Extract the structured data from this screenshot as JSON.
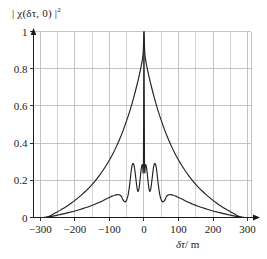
{
  "figure": {
    "ylabel": "| χ(δτ, 0) |",
    "ylabel_exponent": "2",
    "xlabel_symbol": "δτ",
    "xlabel_unit": "/ m",
    "xlabel_full": "δτ/m"
  },
  "chart_data": {
    "type": "line",
    "title": "",
    "subtitle": "",
    "xlabel": "δτ/m",
    "ylabel": "| χ(δτ, 0) |²",
    "xlim": [
      -320,
      310
    ],
    "ylim": [
      0,
      1
    ],
    "xticks": [
      -300,
      -200,
      -100,
      0,
      100,
      200,
      300
    ],
    "xtick_labels": [
      "−300",
      "−200",
      "−100",
      "0",
      "100",
      "200",
      "300"
    ],
    "yticks": [
      0,
      0.2,
      0.4,
      0.6,
      0.8,
      1
    ],
    "ytick_labels": [
      "0",
      "0.2",
      "0.4",
      "0.6",
      "0.8",
      "1"
    ],
    "minor_xtick_interval": 50,
    "grid": true,
    "grid_color": "#b4b4b4",
    "legend": null,
    "legend_position": "none",
    "line_color": "#222222",
    "series": [
      {
        "name": "broad-peak",
        "comment": "Wide near-exponential main lobe, unity at zero delay, decaying to zero near ±280 m",
        "x": [
          -285,
          -280,
          -270,
          -260,
          -250,
          -240,
          -230,
          -220,
          -210,
          -200,
          -190,
          -180,
          -170,
          -160,
          -150,
          -140,
          -130,
          -120,
          -110,
          -100,
          -90,
          -80,
          -70,
          -60,
          -50,
          -40,
          -30,
          -20,
          -14,
          -9,
          -5,
          -2,
          0,
          2,
          5,
          9,
          14,
          20,
          30,
          40,
          50,
          60,
          70,
          80,
          90,
          100,
          110,
          120,
          130,
          140,
          150,
          160,
          170,
          180,
          190,
          200,
          210,
          220,
          230,
          240,
          250,
          260,
          270,
          280,
          285
        ],
        "y": [
          0.0,
          0.003,
          0.011,
          0.021,
          0.031,
          0.042,
          0.053,
          0.065,
          0.078,
          0.092,
          0.107,
          0.123,
          0.14,
          0.158,
          0.178,
          0.2,
          0.224,
          0.25,
          0.278,
          0.309,
          0.343,
          0.381,
          0.423,
          0.47,
          0.522,
          0.579,
          0.643,
          0.715,
          0.763,
          0.806,
          0.845,
          0.895,
          1.0,
          0.895,
          0.845,
          0.806,
          0.763,
          0.715,
          0.643,
          0.579,
          0.522,
          0.47,
          0.423,
          0.381,
          0.343,
          0.309,
          0.278,
          0.25,
          0.224,
          0.2,
          0.178,
          0.158,
          0.14,
          0.123,
          0.107,
          0.092,
          0.078,
          0.065,
          0.053,
          0.042,
          0.031,
          0.021,
          0.011,
          0.003,
          0.0
        ]
      },
      {
        "name": "oscillating-sidelobes",
        "comment": "Lower curve with narrow central spike and symmetric sidelobes peaking near 0.29 at ±30 m, shoulders near 0.12 at ±60 m",
        "x": [
          -290,
          -275,
          -260,
          -245,
          -230,
          -215,
          -200,
          -185,
          -170,
          -155,
          -140,
          -125,
          -110,
          -100,
          -92,
          -85,
          -78,
          -72,
          -68,
          -65,
          -63,
          -61,
          -59,
          -57,
          -55,
          -52,
          -49,
          -46,
          -43,
          -41,
          -39,
          -37,
          -35,
          -33,
          -31,
          -29,
          -27,
          -25,
          -23,
          -21,
          -19,
          -17,
          -15,
          -13,
          -11,
          -9,
          -7,
          -5,
          -3.5,
          -2.5,
          -1.5,
          -0.8,
          0,
          0.8,
          1.5,
          2.5,
          3.5,
          5,
          7,
          9,
          11,
          13,
          15,
          17,
          19,
          21,
          23,
          25,
          27,
          29,
          31,
          33,
          35,
          37,
          39,
          41,
          43,
          46,
          49,
          52,
          55,
          57,
          59,
          61,
          63,
          65,
          68,
          72,
          78,
          85,
          92,
          100,
          110,
          125,
          140,
          155,
          170,
          185,
          200,
          215,
          230,
          245,
          260,
          275,
          290
        ],
        "y": [
          0.0,
          0.004,
          0.009,
          0.015,
          0.021,
          0.028,
          0.035,
          0.043,
          0.052,
          0.062,
          0.073,
          0.085,
          0.1,
          0.108,
          0.115,
          0.12,
          0.123,
          0.122,
          0.118,
          0.112,
          0.104,
          0.096,
          0.09,
          0.086,
          0.084,
          0.088,
          0.1,
          0.12,
          0.155,
          0.185,
          0.215,
          0.25,
          0.275,
          0.288,
          0.29,
          0.282,
          0.262,
          0.232,
          0.2,
          0.17,
          0.148,
          0.14,
          0.15,
          0.175,
          0.21,
          0.245,
          0.272,
          0.285,
          0.27,
          0.24,
          0.3,
          0.66,
          1.0,
          0.66,
          0.3,
          0.24,
          0.27,
          0.285,
          0.272,
          0.245,
          0.21,
          0.175,
          0.15,
          0.14,
          0.148,
          0.17,
          0.2,
          0.232,
          0.262,
          0.282,
          0.29,
          0.288,
          0.275,
          0.25,
          0.215,
          0.185,
          0.155,
          0.12,
          0.1,
          0.088,
          0.084,
          0.086,
          0.09,
          0.096,
          0.104,
          0.112,
          0.118,
          0.122,
          0.123,
          0.12,
          0.115,
          0.108,
          0.1,
          0.085,
          0.073,
          0.062,
          0.052,
          0.043,
          0.035,
          0.028,
          0.021,
          0.015,
          0.009,
          0.004,
          0.0
        ]
      }
    ]
  }
}
